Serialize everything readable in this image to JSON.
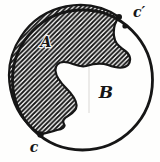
{
  "figure": {
    "region_a_label": "A",
    "region_b_label": "B",
    "point_c_label": "c",
    "point_c_prime_label": "c′",
    "ink_color": "#161616",
    "background_color": "#fefefd",
    "hatch_style": "diagonal-forward-slash"
  }
}
